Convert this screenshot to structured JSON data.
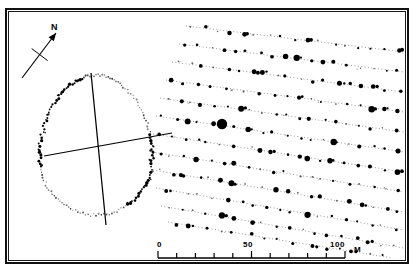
{
  "figure": {
    "type": "survey-map",
    "background_color": "#ffffff",
    "ink_color": "#000000",
    "frame": {
      "outer_border_px": 2,
      "inner_border_px": 1,
      "border_color": "#111111"
    }
  },
  "north_arrow": {
    "label": "N",
    "bearing_deg": 22,
    "name": "north-arrow"
  },
  "scale_bar": {
    "unit_label": "M",
    "ticks": [
      {
        "value": 0,
        "label": "0",
        "major": true
      },
      {
        "value": 10,
        "label": "",
        "major": false
      },
      {
        "value": 20,
        "label": "",
        "major": false
      },
      {
        "value": 30,
        "label": "",
        "major": false
      },
      {
        "value": 40,
        "label": "",
        "major": false
      },
      {
        "value": 50,
        "label": "50",
        "major": true
      },
      {
        "value": 60,
        "label": "",
        "major": false
      },
      {
        "value": 70,
        "label": "",
        "major": false
      },
      {
        "value": 80,
        "label": "",
        "major": false
      },
      {
        "value": 90,
        "label": "",
        "major": false
      },
      {
        "value": 100,
        "label": "100",
        "major": true
      }
    ],
    "min": 0,
    "max": 100,
    "divisions": 10
  },
  "chart_data": {
    "type": "scatter",
    "title": "",
    "xlabel": "",
    "ylabel": "",
    "grid": false,
    "legend": "none",
    "enclosure": {
      "name": "oval-enclosure",
      "center": [
        96,
        145
      ],
      "radius_x": 56,
      "radius_y": 70,
      "point_count": 150,
      "style": "dotted ring of small plotted points"
    },
    "transect_lines_enclosure": [
      {
        "name": "transect-ns",
        "x1": 91,
        "y1": 73,
        "x2": 106,
        "y2": 225
      },
      {
        "name": "transect-ew",
        "x1": 44,
        "y1": 156,
        "x2": 172,
        "y2": 133
      }
    ],
    "traverses": [
      {
        "id": 1,
        "x1": 186,
        "y1": 26,
        "x2": 404,
        "y2": 52,
        "dots": 17
      },
      {
        "id": 2,
        "x1": 179,
        "y1": 44,
        "x2": 404,
        "y2": 72,
        "dots": 18
      },
      {
        "id": 3,
        "x1": 172,
        "y1": 62,
        "x2": 404,
        "y2": 92,
        "dots": 19
      },
      {
        "id": 4,
        "x1": 166,
        "y1": 80,
        "x2": 404,
        "y2": 112,
        "dots": 19
      },
      {
        "id": 5,
        "x1": 160,
        "y1": 98,
        "x2": 404,
        "y2": 132,
        "dots": 20
      },
      {
        "id": 6,
        "x1": 156,
        "y1": 116,
        "x2": 404,
        "y2": 152,
        "dots": 20
      },
      {
        "id": 7,
        "x1": 153,
        "y1": 134,
        "x2": 404,
        "y2": 172,
        "dots": 20
      },
      {
        "id": 8,
        "x1": 152,
        "y1": 152,
        "x2": 404,
        "y2": 192,
        "dots": 20
      },
      {
        "id": 9,
        "x1": 153,
        "y1": 170,
        "x2": 404,
        "y2": 212,
        "dots": 20
      },
      {
        "id": 10,
        "x1": 156,
        "y1": 188,
        "x2": 404,
        "y2": 230,
        "dots": 19
      },
      {
        "id": 11,
        "x1": 161,
        "y1": 206,
        "x2": 404,
        "y2": 248,
        "dots": 18
      },
      {
        "id": 12,
        "x1": 168,
        "y1": 222,
        "x2": 392,
        "y2": 258,
        "dots": 15
      }
    ],
    "notable_anomaly": {
      "name": "largest-anomaly-dot",
      "x": 222,
      "y": 124,
      "radius": 5.2
    },
    "dot_radius_range": [
      0.7,
      3.2
    ]
  }
}
